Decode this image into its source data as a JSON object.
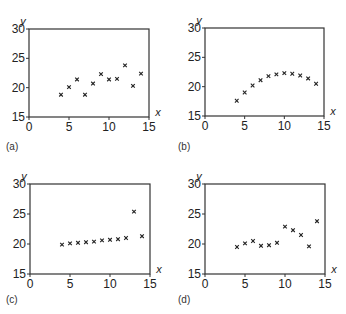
{
  "chart_data": [
    {
      "type": "scatter",
      "panel_label": "(a)",
      "xlabel": "x",
      "ylabel": "y",
      "xlim": [
        0,
        15
      ],
      "ylim": [
        15,
        30
      ],
      "xticks": [
        0,
        5,
        10,
        15
      ],
      "yticks": [
        15,
        20,
        25,
        30
      ],
      "grid": false,
      "marker": "x",
      "x": [
        4,
        5,
        6,
        7,
        8,
        9,
        10,
        11,
        12,
        13,
        14
      ],
      "y": [
        18.8,
        20.1,
        21.4,
        18.8,
        20.7,
        22.3,
        21.4,
        21.5,
        23.8,
        20.3,
        22.4
      ]
    },
    {
      "type": "scatter",
      "panel_label": "(b)",
      "xlabel": "x",
      "ylabel": "y",
      "xlim": [
        0,
        15
      ],
      "ylim": [
        15,
        30
      ],
      "xticks": [
        0,
        5,
        10,
        15
      ],
      "yticks": [
        15,
        20,
        25,
        30
      ],
      "grid": false,
      "marker": "x",
      "x": [
        4,
        5,
        6,
        7,
        8,
        9,
        10,
        11,
        12,
        13,
        14
      ],
      "y": [
        17.6,
        19.0,
        20.2,
        21.1,
        21.8,
        22.1,
        22.3,
        22.2,
        21.9,
        21.4,
        20.5
      ]
    },
    {
      "type": "scatter",
      "panel_label": "(c)",
      "xlabel": "x",
      "ylabel": "y",
      "xlim": [
        0,
        15
      ],
      "ylim": [
        15,
        30
      ],
      "xticks": [
        0,
        5,
        10,
        15
      ],
      "yticks": [
        15,
        20,
        25,
        30
      ],
      "grid": false,
      "marker": "x",
      "x": [
        4,
        5,
        6,
        7,
        8,
        9,
        10,
        11,
        12,
        13,
        14
      ],
      "y": [
        19.9,
        20.1,
        20.2,
        20.3,
        20.4,
        20.6,
        20.7,
        20.8,
        21.0,
        25.4,
        21.3
      ]
    },
    {
      "type": "scatter",
      "panel_label": "(d)",
      "xlabel": "x",
      "ylabel": "y",
      "xlim": [
        0,
        15
      ],
      "ylim": [
        15,
        30
      ],
      "xticks": [
        0,
        5,
        10,
        15
      ],
      "yticks": [
        15,
        20,
        25,
        30
      ],
      "grid": false,
      "marker": "x",
      "x": [
        4,
        5,
        6,
        7,
        8,
        9,
        10,
        11,
        12,
        13,
        14
      ],
      "y": [
        19.5,
        20.1,
        20.5,
        19.7,
        19.8,
        20.2,
        22.9,
        22.3,
        21.5,
        19.6,
        23.8
      ]
    }
  ],
  "layout": {
    "panels": [
      {
        "left": 29,
        "top": 29,
        "right": 149,
        "bottom": 117,
        "label_x": 6,
        "label_y": 150
      },
      {
        "left": 205,
        "top": 28,
        "right": 324,
        "bottom": 116,
        "label_x": 178,
        "label_y": 150
      },
      {
        "left": 30,
        "top": 184,
        "right": 150,
        "bottom": 274,
        "label_x": 6,
        "label_y": 303
      },
      {
        "left": 205,
        "top": 184,
        "right": 325,
        "bottom": 274,
        "label_x": 178,
        "label_y": 303
      }
    ],
    "colors": {
      "axis": "#333333",
      "marker": "#222222",
      "text": "#222222"
    }
  }
}
